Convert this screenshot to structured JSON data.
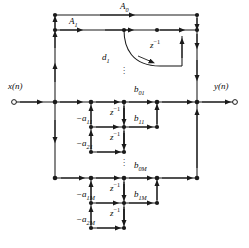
{
  "figure": {
    "type": "signal-flow-graph",
    "width": 249,
    "height": 248,
    "line_color": "#1a1a1a",
    "text_color": "#0a0a0a",
    "background": "#ffffff"
  },
  "io": {
    "input_label": "x(n)",
    "output_label": "y(n)",
    "input_node_x": 14,
    "input_node_y": 102,
    "output_node_x": 235,
    "output_node_y": 102
  },
  "gains": {
    "a0": {
      "text": "A",
      "sub": "0",
      "x": 120,
      "y": 7
    },
    "a1": {
      "text": "A",
      "sub": "1",
      "x": 69,
      "y": 22
    },
    "d1": {
      "text": "d",
      "sub": "1",
      "x": 104,
      "y": 58
    },
    "b01": {
      "text": "b",
      "sub": "01",
      "x": 135,
      "y": 91
    },
    "b11": {
      "text": "b",
      "sub": "11",
      "x": 135,
      "y": 120
    },
    "b0M": {
      "text": "b",
      "sub": "0M",
      "x": 135,
      "y": 167
    },
    "b1M": {
      "text": "b",
      "sub": "1M",
      "x": 135,
      "y": 196
    },
    "a11": {
      "text": "−a",
      "sub": "11",
      "x": 82,
      "y": 120
    },
    "a21": {
      "text": "−a",
      "sub": "21",
      "x": 82,
      "y": 145
    },
    "a1M": {
      "text": "−a",
      "sub": "1M",
      "x": 82,
      "y": 196
    },
    "a2M": {
      "text": "−a",
      "sub": "2M",
      "x": 82,
      "y": 221
    }
  },
  "delays": {
    "label": "z",
    "exponent": "−1",
    "positions": [
      {
        "name": "delay-feedback-top",
        "x": 152,
        "y": 44
      },
      {
        "name": "delay-section1-1",
        "x": 112,
        "y": 111
      },
      {
        "name": "delay-section1-2",
        "x": 112,
        "y": 136
      },
      {
        "name": "delay-sectionM-1",
        "x": 112,
        "y": 187
      },
      {
        "name": "delay-sectionM-2",
        "x": 112,
        "y": 212
      }
    ]
  },
  "ellipses": [
    {
      "name": "vertical-dots-feedback",
      "x": 123,
      "y": 68
    },
    {
      "name": "vertical-dots-sections",
      "x": 123,
      "y": 160
    }
  ],
  "geometry": {
    "rows": {
      "a0_bus": 15,
      "a1_bus": 30,
      "main": 102,
      "sec1_r1": 127,
      "sec1_r2": 152,
      "b0M": 178,
      "secM_r1": 203,
      "secM_r2": 228
    },
    "cols": {
      "left_bus": 55,
      "tap_a": 91,
      "tap_b": 124,
      "tap_c": 157,
      "right_bus": 197
    }
  }
}
